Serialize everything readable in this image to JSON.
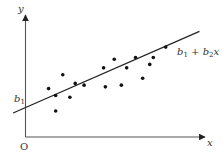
{
  "diagram": {
    "y_axis_label": "y",
    "x_axis_label": "x",
    "origin_label": "O",
    "intercept_label": {
      "base": "b",
      "sub": "1"
    },
    "line_label": {
      "b1": "b",
      "b1_sub": "1",
      "plus": " + ",
      "b2": "b",
      "b2_sub": "2",
      "var": "x"
    },
    "colors": {
      "axis": "#555555",
      "line": "#222222",
      "point": "#111111"
    }
  },
  "chart_data": {
    "type": "scatter",
    "title": "",
    "xlabel": "x",
    "ylabel": "y",
    "xlim": [
      0,
      10
    ],
    "ylim": [
      0,
      7
    ],
    "grid": false,
    "points": [
      {
        "x": 1.3,
        "y": 2.8
      },
      {
        "x": 1.7,
        "y": 2.4
      },
      {
        "x": 1.7,
        "y": 1.5
      },
      {
        "x": 2.1,
        "y": 3.6
      },
      {
        "x": 2.5,
        "y": 2.3
      },
      {
        "x": 2.8,
        "y": 3.1
      },
      {
        "x": 3.3,
        "y": 3.0
      },
      {
        "x": 4.4,
        "y": 4.0
      },
      {
        "x": 4.5,
        "y": 2.9
      },
      {
        "x": 5.0,
        "y": 4.5
      },
      {
        "x": 5.4,
        "y": 3.0
      },
      {
        "x": 5.7,
        "y": 4.0
      },
      {
        "x": 6.2,
        "y": 4.6
      },
      {
        "x": 6.6,
        "y": 3.4
      },
      {
        "x": 7.0,
        "y": 4.2
      },
      {
        "x": 7.2,
        "y": 4.6
      },
      {
        "x": 7.9,
        "y": 5.2
      }
    ],
    "regression_line": {
      "intercept": 1.7,
      "slope": 0.45,
      "x_from": -0.7,
      "x_to": 9.8
    },
    "annotations": [
      "b1",
      "b1 + b2 x"
    ]
  }
}
